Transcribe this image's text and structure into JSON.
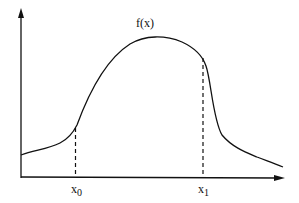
{
  "diagram": {
    "function_label": "f(x)",
    "x0_base": "x",
    "x0_sub": "0",
    "x1_base": "x",
    "x1_sub": "1",
    "colors": {
      "background": "#ffffff",
      "stroke": "#111111"
    }
  }
}
